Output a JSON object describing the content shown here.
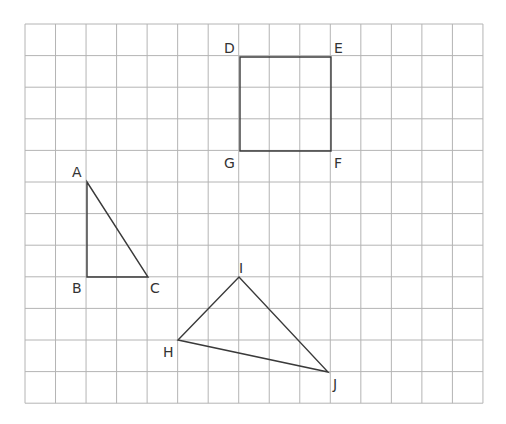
{
  "grid": {
    "x0": 25,
    "y0": 24,
    "cols": 15,
    "rows": 12,
    "cell_w": 30.53,
    "cell_h": 31.6,
    "line_color": "#b4b4b4"
  },
  "shapes": {
    "triangle_abc": {
      "vertices": [
        {
          "name": "A",
          "x": 87,
          "y": 182,
          "lx": 72,
          "ly": 177
        },
        {
          "name": "B",
          "x": 87,
          "y": 277,
          "lx": 72,
          "ly": 293
        },
        {
          "name": "C",
          "x": 148,
          "y": 277,
          "lx": 150,
          "ly": 293
        }
      ]
    },
    "rectangle_defg": {
      "vertices": [
        {
          "name": "D",
          "x": 240,
          "y": 57,
          "lx": 224,
          "ly": 53
        },
        {
          "name": "E",
          "x": 331,
          "y": 57,
          "lx": 334,
          "ly": 53
        },
        {
          "name": "F",
          "x": 331,
          "y": 151,
          "lx": 334,
          "ly": 168
        },
        {
          "name": "G",
          "x": 240,
          "y": 151,
          "lx": 224,
          "ly": 168
        }
      ]
    },
    "triangle_hij": {
      "vertices": [
        {
          "name": "H",
          "x": 178,
          "y": 340,
          "lx": 163,
          "ly": 357
        },
        {
          "name": "I",
          "x": 239,
          "y": 277,
          "lx": 239,
          "ly": 273
        },
        {
          "name": "J",
          "x": 328,
          "y": 372,
          "lx": 333,
          "ly": 389
        }
      ]
    }
  },
  "stroke_color": "#3a3a3a"
}
